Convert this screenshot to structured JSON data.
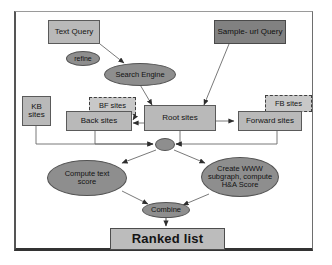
{
  "diagram": {
    "type": "flowchart",
    "colors": {
      "box_fill": "#b9b9b9",
      "box_dark_fill": "#818181",
      "ellipse_fill": "#8e8e8e",
      "dashed_fill": "#c8c8c8",
      "stroke": "#4d4d4d",
      "frame": "#333333",
      "background": "#ffffff"
    },
    "nodes": {
      "text_query": {
        "label": "Text Query",
        "shape": "box",
        "style": "light"
      },
      "sample_url_query": {
        "label": "Sample- url Query",
        "shape": "box",
        "style": "dark"
      },
      "refine": {
        "label": "refine",
        "shape": "ellipse"
      },
      "search_engine": {
        "label": "Search Engine",
        "shape": "ellipse"
      },
      "kb_sites": {
        "label": "KB\nsites",
        "shape": "box",
        "style": "light"
      },
      "bf_sites": {
        "label": "BF sites",
        "shape": "box",
        "style": "dashed"
      },
      "fb_sites": {
        "label": "FB sites",
        "shape": "box",
        "style": "dashed"
      },
      "back_sites": {
        "label": "Back sites",
        "shape": "box",
        "style": "light"
      },
      "root_sites": {
        "label": "Root sites",
        "shape": "box",
        "style": "light"
      },
      "forward_sites": {
        "label": "Forward sites",
        "shape": "box",
        "style": "light"
      },
      "junction": {
        "label": "",
        "shape": "ellipse"
      },
      "compute_text_score": {
        "label": "Compute text\nscore",
        "shape": "ellipse"
      },
      "create_www_subgraph": {
        "label": "Create WWW\nsubgraph, compute\nH&A Score",
        "shape": "ellipse"
      },
      "combine": {
        "label": "Combine",
        "shape": "ellipse"
      },
      "ranked_list": {
        "label": "Ranked list",
        "shape": "box",
        "style": "result"
      }
    },
    "edges": [
      {
        "from": "text_query",
        "to": "search_engine",
        "arrow": true
      },
      {
        "from": "sample_url_query",
        "to": "root_sites",
        "arrow": true
      },
      {
        "from": "search_engine",
        "to": "root_sites",
        "arrow": true
      },
      {
        "from": "root_sites",
        "to": "back_sites",
        "arrow": true
      },
      {
        "from": "bf_sites",
        "to": "back_sites",
        "arrow": true
      },
      {
        "from": "root_sites",
        "to": "forward_sites",
        "arrow": true
      },
      {
        "from": "fb_sites",
        "to": "forward_sites",
        "arrow": true
      },
      {
        "from": "kb_sites",
        "to": "junction",
        "arrow": true
      },
      {
        "from": "back_sites",
        "to": "junction",
        "arrow": true
      },
      {
        "from": "root_sites",
        "to": "junction",
        "arrow": true
      },
      {
        "from": "forward_sites",
        "to": "junction",
        "arrow": true
      },
      {
        "from": "junction",
        "to": "compute_text_score",
        "arrow": true
      },
      {
        "from": "junction",
        "to": "create_www_subgraph",
        "arrow": true
      },
      {
        "from": "compute_text_score",
        "to": "combine",
        "arrow": true
      },
      {
        "from": "create_www_subgraph",
        "to": "combine",
        "arrow": true
      },
      {
        "from": "combine",
        "to": "ranked_list",
        "arrow": true
      }
    ]
  }
}
